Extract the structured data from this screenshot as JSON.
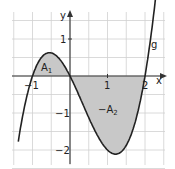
{
  "diagram": {
    "function_label": "g",
    "axis_x_label": "x",
    "axis_y_label": "y",
    "area1_label": "A",
    "area1_sub": "1",
    "area2_label": "−A",
    "area2_sub": "2",
    "ticks_x": [
      "−1",
      "1",
      "2"
    ],
    "ticks_y": [
      "1",
      "−1",
      "−2"
    ],
    "colors": {
      "curve": "#222222",
      "fill": "#c8c8c8",
      "grid": "#d0d0d0",
      "axis": "#333333"
    }
  },
  "chart_data": {
    "type": "line",
    "title": "",
    "xlabel": "x",
    "ylabel": "y",
    "function": "g(x) = x^3 - x^2 - 2x",
    "zeros": [
      -1,
      0,
      2
    ],
    "xlim": [
      -1.5,
      2.5
    ],
    "ylim": [
      -2.3,
      1.5
    ],
    "shaded_regions": [
      {
        "name": "A1",
        "x_from": -1,
        "x_to": 0,
        "sign": "above axis"
      },
      {
        "name": "-A2",
        "x_from": 0,
        "x_to": 2,
        "sign": "below axis"
      }
    ],
    "grid": true,
    "grid_step": 0.5
  }
}
